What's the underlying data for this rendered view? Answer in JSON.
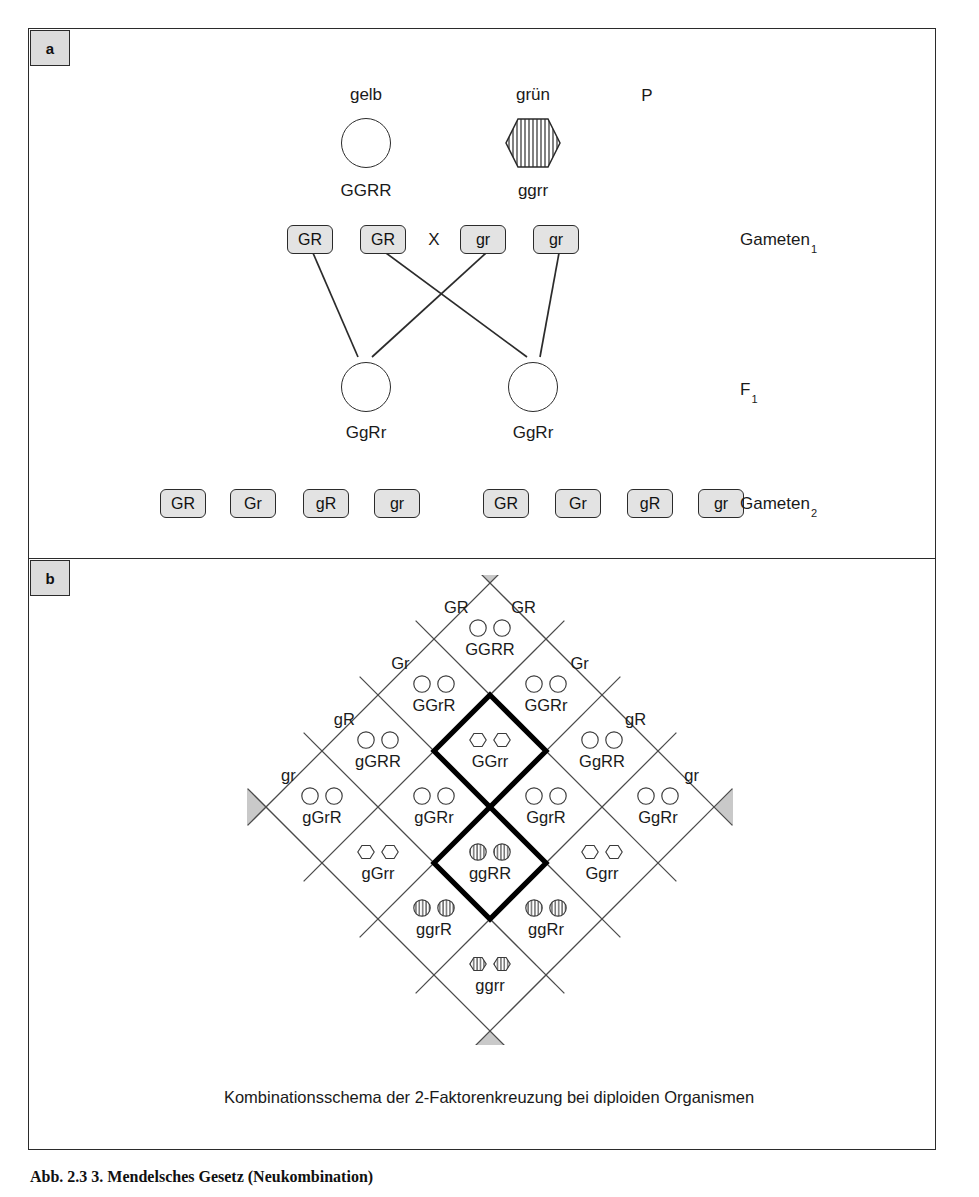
{
  "figure": {
    "caption": "Abb. 2.3  3. Mendelsches Gesetz (Neukombination)",
    "panels": {
      "a_label": "a",
      "b_label": "b"
    }
  },
  "panel_a": {
    "generation_labels": {
      "parental": "P",
      "gameten1": "Gameten",
      "gameten1_sub": "1",
      "f1": "F",
      "f1_sub": "1",
      "gameten2": "Gameten",
      "gameten2_sub": "2"
    },
    "cross_symbol": "X",
    "parents": [
      {
        "phenotype": "gelb",
        "genotype": "GGRR",
        "shape": "circle-open",
        "x": 366
      },
      {
        "phenotype": "grün",
        "genotype": "ggrr",
        "shape": "hexagon-striped",
        "x": 533
      }
    ],
    "gameten1": [
      {
        "label": "GR",
        "x": 310
      },
      {
        "label": "GR",
        "x": 383
      },
      {
        "label": "gr",
        "x": 483
      },
      {
        "label": "gr",
        "x": 556
      }
    ],
    "f1": [
      {
        "genotype": "GgRr",
        "shape": "circle-open",
        "x": 366
      },
      {
        "genotype": "GgRr",
        "shape": "circle-open",
        "x": 533
      }
    ],
    "gameten2": [
      {
        "label": "GR",
        "x": 183
      },
      {
        "label": "Gr",
        "x": 253
      },
      {
        "label": "gR",
        "x": 326
      },
      {
        "label": "gr",
        "x": 397
      },
      {
        "label": "GR",
        "x": 506
      },
      {
        "label": "Gr",
        "x": 578
      },
      {
        "label": "gR",
        "x": 650
      },
      {
        "label": "gr",
        "x": 721
      }
    ]
  },
  "panel_b": {
    "caption": "Kombinationsschema der 2-Faktorenkreuzung bei diploiden Organismen",
    "edge_labels_top_left": [
      "GR",
      "Gr",
      "gR",
      "gr"
    ],
    "edge_labels_top_right": [
      "GR",
      "Gr",
      "gR",
      "gr"
    ],
    "gametes": [
      "GR",
      "Gr",
      "gR",
      "gr"
    ],
    "apex_markers": [
      "triangle-top",
      "triangle-left",
      "triangle-right",
      "triangle-bottom"
    ],
    "highlighted_cells": [
      "GGrr",
      "ggRR"
    ],
    "grid": [
      [
        {
          "genotype": "GGRR",
          "symbol": "circle-open"
        },
        {
          "genotype": "GGRr",
          "symbol": "circle-open"
        },
        {
          "genotype": "GgRR",
          "symbol": "circle-open"
        },
        {
          "genotype": "GgRr",
          "symbol": "circle-open"
        }
      ],
      [
        {
          "genotype": "GGrR",
          "symbol": "circle-open"
        },
        {
          "genotype": "GGrr",
          "symbol": "hexagon-open"
        },
        {
          "genotype": "GgrR",
          "symbol": "circle-open"
        },
        {
          "genotype": "Ggrr",
          "symbol": "hexagon-open"
        }
      ],
      [
        {
          "genotype": "gGRR",
          "symbol": "circle-open"
        },
        {
          "genotype": "gGRr",
          "symbol": "circle-open"
        },
        {
          "genotype": "ggRR",
          "symbol": "circle-striped"
        },
        {
          "genotype": "ggRr",
          "symbol": "circle-striped"
        }
      ],
      [
        {
          "genotype": "gGrR",
          "symbol": "circle-open"
        },
        {
          "genotype": "gGrr",
          "symbol": "hexagon-open"
        },
        {
          "genotype": "ggrR",
          "symbol": "circle-striped"
        },
        {
          "genotype": "ggrr",
          "symbol": "hexagon-striped"
        }
      ]
    ]
  },
  "colors": {
    "ink": "#1a1a1a",
    "frame": "#2b2b2b",
    "chip_fill": "#e3e3e3",
    "badge_fill": "#dcdcdc",
    "grid_line": "#4a4a4a",
    "highlight": "#000000",
    "marker_fill": "#c9c9c9"
  }
}
